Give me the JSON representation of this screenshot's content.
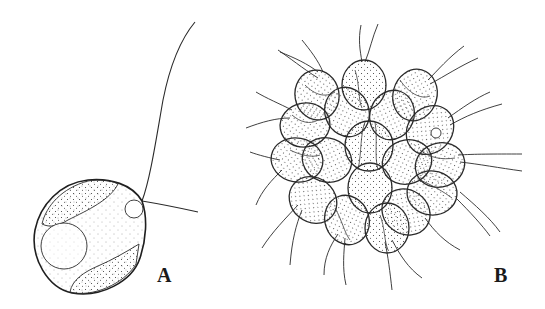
{
  "figure": {
    "background": "#ffffff",
    "ink_color": "#2a2a2a",
    "panels": [
      {
        "id": "A",
        "label": "A",
        "description": "single ovoid cell with one long flagellum, stippled cytoplasm, large circular nucleus, small vacuole near flagellar base"
      },
      {
        "id": "B",
        "label": "B",
        "description": "spherical colony of ~16 stippled ovoid cells radiating flagella"
      }
    ]
  }
}
